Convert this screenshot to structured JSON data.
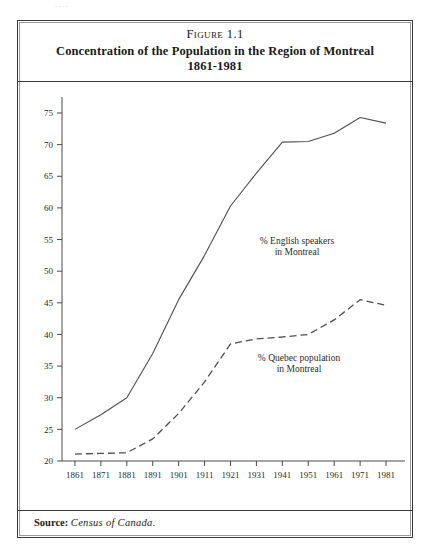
{
  "page": {
    "bleed_text": "...."
  },
  "figure": {
    "label_prefix": "Figure",
    "label_number": "1.1",
    "title_line1": "Concentration of the Population in the Region of Montreal",
    "title_line2": "1861-1981"
  },
  "source": {
    "label": "Source:",
    "value": "Census of Canada."
  },
  "annotations": {
    "english": {
      "line1": "% English speakers",
      "line2": "in Montreal"
    },
    "quebec": {
      "line1": "% Quebec population",
      "line2": "in Montreal"
    }
  },
  "chart_data": {
    "type": "line",
    "title": "Concentration of the Population in the Region of Montreal 1861-1981",
    "xlabel": "",
    "ylabel": "",
    "categories": [
      "1861",
      "1871",
      "1881",
      "1891",
      "1901",
      "1911",
      "1921",
      "1931",
      "1941",
      "1951",
      "1961",
      "1971",
      "1981"
    ],
    "x_tick_labels": [
      "1861",
      "1871",
      "1881",
      "1891",
      "1901",
      "1911",
      "1921",
      "1931",
      "1941",
      "1951",
      "1961",
      "1971",
      "1981"
    ],
    "y_tick_labels": [
      "20",
      "25",
      "30",
      "35",
      "40",
      "45",
      "50",
      "55",
      "60",
      "65",
      "70",
      "75"
    ],
    "y_ticks": [
      20,
      25,
      30,
      35,
      40,
      45,
      50,
      55,
      60,
      65,
      70,
      75
    ],
    "ylim": [
      18.5,
      77.5
    ],
    "grid": false,
    "legend_position": "inline-annotation",
    "series": [
      {
        "name": "% English speakers in Montreal",
        "style": "solid",
        "color": "#4f4f4f",
        "values": [
          25.0,
          27.3,
          30.0,
          37.0,
          45.5,
          52.5,
          60.3,
          65.5,
          70.4,
          70.5,
          71.8,
          74.3,
          73.4
        ]
      },
      {
        "name": "% Quebec population in Montreal",
        "style": "dashed",
        "color": "#4f4f4f",
        "values": [
          21.1,
          21.2,
          21.3,
          23.5,
          27.5,
          32.5,
          38.5,
          39.3,
          39.6,
          40.0,
          42.3,
          45.5,
          44.6
        ]
      }
    ]
  }
}
